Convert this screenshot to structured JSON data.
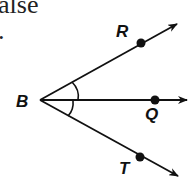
{
  "text_fragments": {
    "top": "alse",
    "period": "."
  },
  "diagram": {
    "vertex": "B",
    "points": [
      "R",
      "Q",
      "T"
    ],
    "rays": [
      "BR",
      "BQ",
      "BT"
    ],
    "angle_marks": [
      "RBQ",
      "QBT"
    ]
  }
}
